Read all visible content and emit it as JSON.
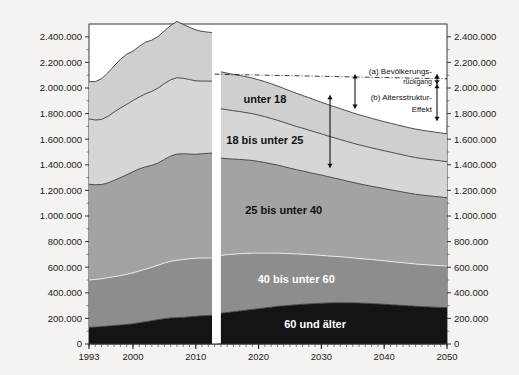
{
  "chart_data": {
    "type": "area",
    "stacked": true,
    "title": "",
    "subtitle": "",
    "xlabel": "",
    "ylabel": "",
    "xlim": [
      1993,
      2050
    ],
    "ylim": [
      0,
      2500000
    ],
    "x_ticks": [
      1993,
      2000,
      2010,
      2020,
      2030,
      2040,
      2050
    ],
    "x_tick_labels": [
      "1993",
      "2000",
      "2010",
      "2020",
      "2030",
      "2040",
      "2050"
    ],
    "y_ticks": [
      0,
      200000,
      400000,
      600000,
      800000,
      1000000,
      1200000,
      1400000,
      1600000,
      1800000,
      2000000,
      2200000,
      2400000
    ],
    "y_tick_labels": [
      "0",
      "200.000",
      "400.000",
      "600.000",
      "800.000",
      "1.000.000",
      "1.200.000",
      "1.400.000",
      "1.600.000",
      "1.800.000",
      "2.000.000",
      "2.200.000",
      "2.400.000"
    ],
    "y_axis_right_labels": [
      "0",
      "200.000",
      "400.000",
      "600.000",
      "800.000",
      "1.000.000",
      "1.200.000",
      "1.400.000",
      "1.600.000",
      "1.800.000",
      "2.000.000",
      "2.200.000",
      "2.400.000"
    ],
    "grid": false,
    "legend_position": "inline-band-labels",
    "projection_break_year": 2013,
    "x": [
      1993,
      1994,
      1995,
      1996,
      1997,
      1998,
      1999,
      2000,
      2001,
      2002,
      2003,
      2004,
      2005,
      2006,
      2007,
      2008,
      2009,
      2010,
      2011,
      2012,
      2013,
      2014,
      2015,
      2016,
      2017,
      2018,
      2019,
      2020,
      2021,
      2022,
      2023,
      2024,
      2025,
      2026,
      2027,
      2028,
      2029,
      2030,
      2031,
      2032,
      2033,
      2034,
      2035,
      2036,
      2037,
      2038,
      2039,
      2040,
      2041,
      2042,
      2043,
      2044,
      2045,
      2046,
      2047,
      2048,
      2049,
      2050
    ],
    "series": [
      {
        "name": "60 und älter",
        "color": "#141414",
        "label_color": "#ffffff",
        "values": [
          130000,
          132000,
          136000,
          140000,
          144000,
          148000,
          152000,
          158000,
          166000,
          174000,
          182000,
          190000,
          198000,
          204000,
          206000,
          208000,
          212000,
          216000,
          220000,
          222000,
          224000,
          240000,
          246000,
          252000,
          258000,
          264000,
          270000,
          276000,
          282000,
          288000,
          294000,
          298000,
          302000,
          306000,
          310000,
          313000,
          316000,
          318000,
          320000,
          321000,
          322000,
          322000,
          321000,
          320000,
          318000,
          316000,
          313000,
          310000,
          307000,
          304000,
          301000,
          298000,
          295000,
          292000,
          290000,
          288000,
          286000,
          284000
        ]
      },
      {
        "name": "40 bis unter 60",
        "color": "#8d8d8d",
        "label_color": "#ffffff",
        "values": [
          370000,
          372000,
          374000,
          378000,
          382000,
          386000,
          392000,
          398000,
          404000,
          410000,
          418000,
          426000,
          434000,
          442000,
          448000,
          452000,
          454000,
          454000,
          452000,
          450000,
          448000,
          452000,
          452000,
          450000,
          448000,
          444000,
          440000,
          434000,
          428000,
          422000,
          416000,
          410000,
          404000,
          398000,
          392000,
          386000,
          380000,
          374000,
          368000,
          364000,
          360000,
          356000,
          352000,
          348000,
          346000,
          344000,
          342000,
          340000,
          338000,
          336000,
          334000,
          332000,
          330000,
          329000,
          328000,
          327000,
          326000,
          325000
        ]
      },
      {
        "name": "25 bis unter 40",
        "color": "#a3a3a3",
        "label_color": "#111111",
        "values": [
          748000,
          740000,
          736000,
          740000,
          752000,
          766000,
          778000,
          790000,
          798000,
          800000,
          796000,
          798000,
          810000,
          822000,
          830000,
          826000,
          818000,
          812000,
          814000,
          818000,
          820000,
          760000,
          750000,
          742000,
          736000,
          730000,
          724000,
          716000,
          708000,
          698000,
          688000,
          678000,
          668000,
          658000,
          650000,
          642000,
          634000,
          628000,
          620000,
          612000,
          604000,
          596000,
          590000,
          584000,
          578000,
          572000,
          568000,
          564000,
          560000,
          556000,
          552000,
          548000,
          545000,
          542000,
          540000,
          538000,
          536000,
          534000
        ]
      },
      {
        "name": "18 bis unter 25",
        "color": "#d6d6d6",
        "label_color": "#111111",
        "values": [
          510000,
          506000,
          508000,
          520000,
          534000,
          544000,
          550000,
          556000,
          562000,
          570000,
          578000,
          586000,
          592000,
          596000,
          596000,
          590000,
          582000,
          574000,
          568000,
          564000,
          562000,
          386000,
          382000,
          378000,
          374000,
          370000,
          366000,
          362000,
          358000,
          354000,
          350000,
          346000,
          342000,
          338000,
          334000,
          330000,
          326000,
          322000,
          318000,
          315000,
          312000,
          309000,
          306000,
          304000,
          302000,
          300000,
          298000,
          296000,
          294000,
          292000,
          290000,
          288000,
          287000,
          286000,
          285000,
          284000,
          283000,
          282000
        ]
      },
      {
        "name": "unter 18",
        "color": "#cfcfcf",
        "label_color": "#111111",
        "values": [
          292000,
          300000,
          318000,
          340000,
          360000,
          380000,
          392000,
          386000,
          396000,
          404000,
          400000,
          402000,
          412000,
          424000,
          440000,
          420000,
          408000,
          398000,
          388000,
          382000,
          378000,
          288000,
          286000,
          284000,
          282000,
          280000,
          278000,
          276000,
          274000,
          271000,
          268000,
          265000,
          262000,
          259000,
          256000,
          253000,
          250000,
          247000,
          245000,
          243000,
          241000,
          239000,
          237000,
          235000,
          233000,
          231000,
          229000,
          227000,
          226000,
          225000,
          224000,
          223000,
          222000,
          221000,
          220000,
          219000,
          218000,
          217000
        ]
      }
    ],
    "reference_line": {
      "name": "Bevölkerung konstante Altersstruktur",
      "style": "dash-dot",
      "color": "#222222",
      "x": [
        2013,
        2050
      ],
      "values": [
        2108000,
        2072000
      ]
    },
    "annotations": [
      {
        "id": "a",
        "label_line1": "(a) Bevölkerungs-",
        "label_line2": "rückgang",
        "arrow": "double-headed-vertical"
      },
      {
        "id": "b",
        "label_line1": "(b) Altersstruktur-",
        "label_line2": "Effekt",
        "arrow": "double-headed-vertical"
      }
    ],
    "band_labels": [
      "unter 18",
      "18 bis unter 25",
      "25 bis unter 40",
      "40 bis unter 60",
      "60 und älter"
    ]
  }
}
